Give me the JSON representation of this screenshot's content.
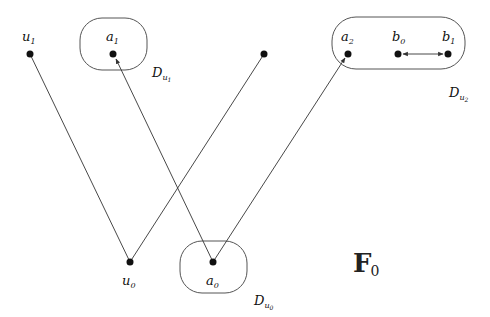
{
  "figure": {
    "title": "F",
    "title_subscript": "0",
    "colors": {
      "stroke": "#333333",
      "node": "#111111",
      "background": "#ffffff"
    },
    "nodes": [
      {
        "id": "u1",
        "label": "u",
        "sub": "1",
        "x": 30,
        "y": 54
      },
      {
        "id": "a1",
        "label": "a",
        "sub": "1",
        "x": 113,
        "y": 54
      },
      {
        "id": "t",
        "label": "",
        "sub": "",
        "x": 264,
        "y": 54
      },
      {
        "id": "a2",
        "label": "a",
        "sub": "2",
        "x": 348,
        "y": 54
      },
      {
        "id": "b0",
        "label": "b",
        "sub": "0",
        "x": 398,
        "y": 54
      },
      {
        "id": "b1",
        "label": "b",
        "sub": "1",
        "x": 448,
        "y": 54
      },
      {
        "id": "u0",
        "label": "u",
        "sub": "0",
        "x": 130,
        "y": 262
      },
      {
        "id": "a0",
        "label": "a",
        "sub": "0",
        "x": 213,
        "y": 262
      }
    ],
    "edges": [
      {
        "from": "u1",
        "to": "u0",
        "arrow": "none"
      },
      {
        "from": "u0",
        "to": "t",
        "arrow": "none"
      },
      {
        "from": "a0",
        "to": "a1",
        "arrow": "end"
      },
      {
        "from": "a0",
        "to": "a2",
        "arrow": "end"
      },
      {
        "from": "b0",
        "to": "b1",
        "arrow": "both"
      }
    ],
    "regions": [
      {
        "id": "D_u1",
        "label": "D",
        "sub": "u",
        "subsub": "1"
      },
      {
        "id": "D_u2",
        "label": "D",
        "sub": "u",
        "subsub": "2"
      },
      {
        "id": "D_u0",
        "label": "D",
        "sub": "u",
        "subsub": "0"
      }
    ]
  }
}
